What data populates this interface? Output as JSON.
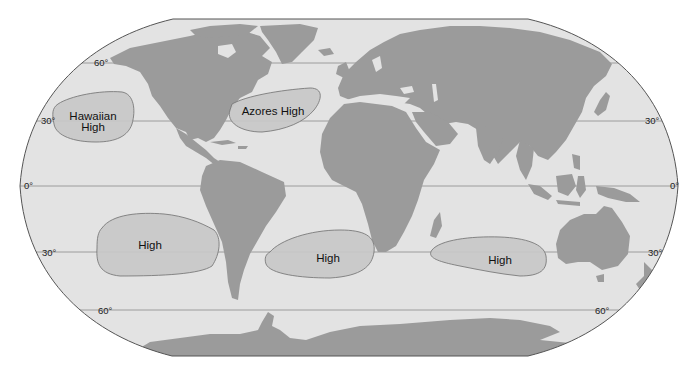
{
  "map": {
    "title": "Subtropical High Pressure Cells",
    "projection": "Robinson-like world map",
    "colors": {
      "background": "#ffffff",
      "ocean": "#e3e3e3",
      "land": "#9b9b9b",
      "high_fill": "#c8c8c8",
      "high_stroke": "#7a7a7a",
      "outline": "#555555",
      "gridline": "#8a8a8a",
      "label": "#1a1a1a"
    },
    "latitude_lines": [
      {
        "label": "60°",
        "lat": 60,
        "y": 63
      },
      {
        "label": "30°",
        "lat": 30,
        "y": 121
      },
      {
        "label": "0°",
        "lat": 0,
        "y": 186
      },
      {
        "label": "30°",
        "lat": -30,
        "y": 252
      },
      {
        "label": "60°",
        "lat": -60,
        "y": 310
      }
    ],
    "latitude_labels": {
      "n60_left": "60°",
      "n30_left": "30°",
      "n30_right": "30°",
      "eq_left": "0°",
      "eq_right": "0°",
      "s30_left": "30°",
      "s30_right": "30°",
      "s60_left": "60°",
      "s60_right": "60°"
    },
    "pressure_cells": [
      {
        "id": "hawaiian",
        "line1": "Hawaiian",
        "line2": "High",
        "ocean": "North Pacific"
      },
      {
        "id": "azores",
        "line1": "Azores High",
        "ocean": "North Atlantic"
      },
      {
        "id": "south-pacific",
        "line1": "High",
        "ocean": "South Pacific"
      },
      {
        "id": "south-atlantic",
        "line1": "High",
        "ocean": "South Atlantic"
      },
      {
        "id": "indian",
        "line1": "High",
        "ocean": "South Indian"
      }
    ]
  }
}
